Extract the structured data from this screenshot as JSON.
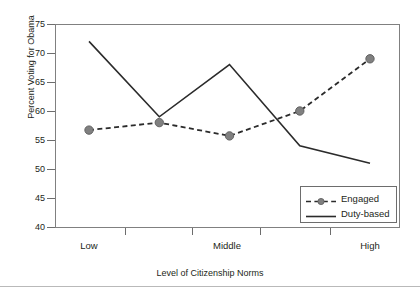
{
  "chart_data": {
    "type": "line",
    "title": "",
    "xlabel": "Level of Citizenship Norms",
    "ylabel": "Percent Voting for Obama",
    "categories": [
      "Low",
      "",
      "Middle",
      "",
      "High"
    ],
    "x_tick_labels": [
      "Low",
      "Middle",
      "High"
    ],
    "y_tick_labels": [
      "40",
      "45",
      "50",
      "55",
      "60",
      "65",
      "70",
      "75"
    ],
    "ylim": [
      40,
      75
    ],
    "y_step": 5,
    "grid": false,
    "legend_position": "bottom-right",
    "series": [
      {
        "name": "Engaged",
        "style": "dashed-with-markers",
        "color": "#2b2b2b",
        "marker_color": "#808080",
        "values": [
          56.7,
          58.0,
          55.7,
          60.0,
          69.0
        ]
      },
      {
        "name": "Duty-based",
        "style": "solid",
        "color": "#2b2b2b",
        "marker_color": "",
        "values": [
          72.0,
          59.0,
          68.0,
          54.0,
          51.0
        ]
      }
    ]
  },
  "axes": {
    "y_title": "Percent Voting for Obama",
    "x_title": "Level of Citizenship Norms",
    "y_ticks": [
      "75",
      "70",
      "65",
      "60",
      "55",
      "50",
      "45",
      "40"
    ],
    "x_ticks": [
      "Low",
      "Middle",
      "High"
    ]
  },
  "legend": {
    "entries": [
      {
        "label": "Engaged"
      },
      {
        "label": "Duty-based"
      }
    ]
  }
}
